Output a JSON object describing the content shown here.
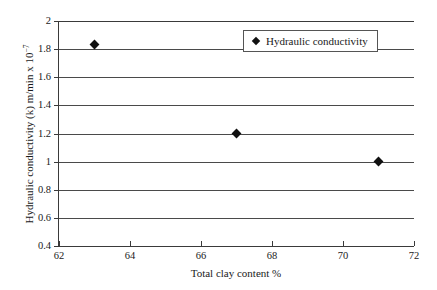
{
  "chart_data": {
    "type": "scatter",
    "title": "",
    "xlabel": "Total clay content %",
    "ylabel": "Hydraulic conductivity (k) m/min x 10",
    "ylabel_exponent": "−7",
    "xlim": [
      62,
      72
    ],
    "ylim": [
      0.4,
      2
    ],
    "xticks": [
      "62",
      "64",
      "66",
      "68",
      "70",
      "72"
    ],
    "xtick_values": [
      62,
      64,
      66,
      68,
      70,
      72
    ],
    "yticks": [
      "0.4",
      "0.6",
      "0.8",
      "1",
      "1.2",
      "1.4",
      "1.6",
      "1.8",
      "2"
    ],
    "ytick_values": [
      0.4,
      0.6,
      0.8,
      1.0,
      1.2,
      1.4,
      1.6,
      1.8,
      2.0
    ],
    "grid": "horizontal",
    "legend_position": "top-right",
    "marker": "diamond",
    "series": [
      {
        "name": "Hydraulic conductivity",
        "color": "#111111",
        "x": [
          63,
          67,
          71
        ],
        "y": [
          1.83,
          1.2,
          1.0
        ]
      }
    ]
  },
  "legend": {
    "entries": [
      {
        "label": "Hydraulic conductivity",
        "marker_icon": "diamond-marker-icon"
      }
    ]
  }
}
